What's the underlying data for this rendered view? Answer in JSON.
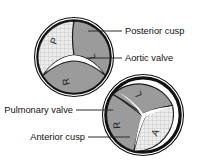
{
  "figure": {
    "background_color": "#ffffff",
    "ink_color": "#111111",
    "cusp_dark_color": "#9b9b9b",
    "cusp_light_color": "#e8e8e8"
  },
  "labels": {
    "posterior_cusp": "Posterior cusp",
    "aortic_valve": "Aortic valve",
    "pulmonary_valve": "Pulmonary valve",
    "anterior_cusp": "Anterior cusp"
  },
  "valves": [
    {
      "name": "pulmonary-valve",
      "position": "upper-left",
      "center_x": 74,
      "center_y": 57,
      "radius": 39,
      "cusps": [
        {
          "letter": "P",
          "full": "Posterior cusp",
          "shading": "light",
          "x": 57,
          "y": 42
        },
        {
          "letter": "L",
          "full": "Left cusp",
          "shading": "dark",
          "x": 95,
          "y": 55
        },
        {
          "letter": "R",
          "full": "Right cusp",
          "shading": "dark",
          "x": 69,
          "y": 80
        }
      ]
    },
    {
      "name": "aortic-valve",
      "position": "lower-right",
      "center_x": 143,
      "center_y": 115,
      "radius": 40,
      "cusps": [
        {
          "letter": "L",
          "full": "Left cusp",
          "shading": "dark",
          "x": 141,
          "y": 92
        },
        {
          "letter": "R",
          "full": "Right cusp",
          "shading": "dark",
          "x": 120,
          "y": 124
        },
        {
          "letter": "A",
          "full": "Anterior cusp",
          "shading": "light",
          "x": 158,
          "y": 133
        }
      ]
    }
  ],
  "leaders": [
    {
      "name": "posterior-cusp-leader",
      "x1": 88,
      "y1": 31,
      "x2": 122,
      "y2": 31
    },
    {
      "name": "aortic-valve-leader",
      "x1": 86,
      "y1": 58,
      "x2": 122,
      "y2": 58
    },
    {
      "name": "pulmonary-valve-leader",
      "x1": 76,
      "y1": 110,
      "x2": 113,
      "y2": 110
    },
    {
      "name": "anterior-cusp-leader",
      "x1": 88,
      "y1": 137,
      "x2": 130,
      "y2": 137
    }
  ],
  "label_positions": {
    "posterior_cusp": {
      "x": 125,
      "y": 34,
      "anchor": "start"
    },
    "aortic_valve": {
      "x": 125,
      "y": 61,
      "anchor": "start"
    },
    "pulmonary_valve": {
      "x": 73,
      "y": 113,
      "anchor": "end"
    },
    "anterior_cusp": {
      "x": 85,
      "y": 140,
      "anchor": "end"
    }
  }
}
